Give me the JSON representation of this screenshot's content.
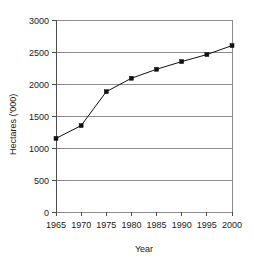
{
  "chart_data": {
    "type": "line",
    "title": "",
    "subtitle": "",
    "xlabel": "Year",
    "ylabel": "Hectares ('000)",
    "categories": [
      "1965",
      "1970",
      "1975",
      "1980",
      "1985",
      "1990",
      "1995",
      "2000"
    ],
    "x": [
      1965,
      1970,
      1975,
      1980,
      1985,
      1990,
      1995,
      2000
    ],
    "values": [
      1150,
      1350,
      1880,
      2090,
      2230,
      2350,
      2460,
      2600
    ],
    "series": [
      {
        "name": "Hectares",
        "values": [
          1150,
          1350,
          1880,
          2090,
          2230,
          2350,
          2460,
          2600
        ],
        "color": "#111111",
        "marker": "square"
      }
    ],
    "ylim": [
      0,
      3000
    ],
    "xlim": [
      1965,
      2000
    ],
    "yticks": [
      0,
      500,
      1000,
      1500,
      2000,
      2500,
      3000
    ],
    "ytick_labels": [
      "0",
      "500",
      "1000",
      "1500",
      "2000",
      "2500",
      "3000"
    ],
    "xtick_labels": [
      "1965",
      "1970",
      "1975",
      "1980",
      "1985",
      "1990",
      "1995",
      "2000"
    ],
    "grid": "horizontal",
    "legend": "none",
    "grid_color": "#8c8c8c",
    "axis_color": "#4d4d4d",
    "background": "#ffffff"
  }
}
